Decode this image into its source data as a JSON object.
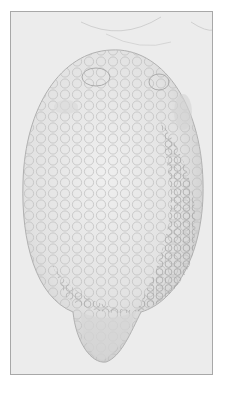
{
  "image": {
    "subject": "ovoid specimen illustration with cellular/granular texture and tapering lower lobe",
    "colors": {
      "background": "#ffffff",
      "frame_fill": "#ececec",
      "frame_border": "#a8a8a8",
      "body_fill": "#e4e4e4",
      "cell_stroke": "#b4b4b4",
      "shadow": "#9a9a9a"
    }
  }
}
